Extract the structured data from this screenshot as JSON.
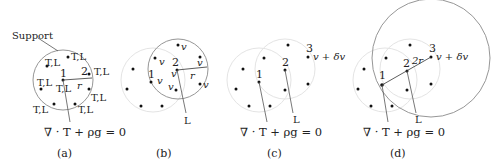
{
  "figure": {
    "panels": [
      {
        "id": "a",
        "caption": "(a)",
        "callout": "Support",
        "equation": "∇ · T + ρg = 0",
        "node_label": "T,L",
        "point_1": "1",
        "point_2": "2",
        "radius_label": "r"
      },
      {
        "id": "b",
        "caption": "(b)",
        "node_label": "v",
        "point_1": "1",
        "point_2": "2",
        "radius_label": "r",
        "line_label": "L"
      },
      {
        "id": "c",
        "caption": "(c)",
        "equation": "∇ · T + ρg = 0",
        "point_1": "1",
        "point_2": "2",
        "point_3": "3",
        "point_3_label": "v + δv",
        "line_label": "L"
      },
      {
        "id": "d",
        "caption": "(d)",
        "equation": "∇ · T + ρg = 0",
        "point_1": "1",
        "point_2": "2",
        "point_3": "3",
        "point_3_label": "v + δv",
        "radius_label": "2r",
        "line_label": "L"
      }
    ]
  }
}
